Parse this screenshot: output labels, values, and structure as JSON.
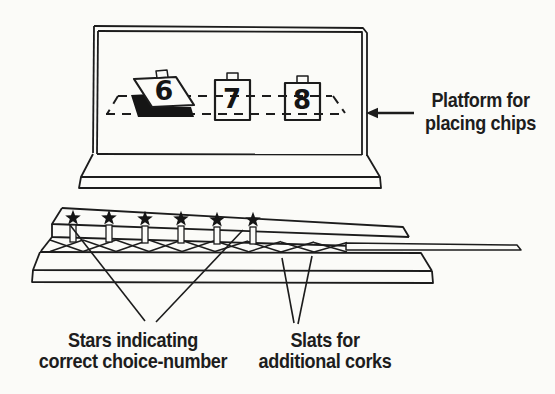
{
  "figure": {
    "type": "apparatus-line-drawing",
    "ink_color": "#1c1c1c",
    "paper_color": "#fbfbf8"
  },
  "cards": {
    "card1": "6",
    "card2": "7",
    "card3": "8",
    "card1_state": "tilted-open-showing-dark-slot",
    "count": 3
  },
  "stars": {
    "count": 6
  },
  "labels": {
    "platform": {
      "line1": "Platform for",
      "line2": "placing chips"
    },
    "stars": {
      "line1": "Stars indicating",
      "line2": "correct choice-number"
    },
    "slats": {
      "line1": "Slats for",
      "line2": "additional corks"
    }
  }
}
